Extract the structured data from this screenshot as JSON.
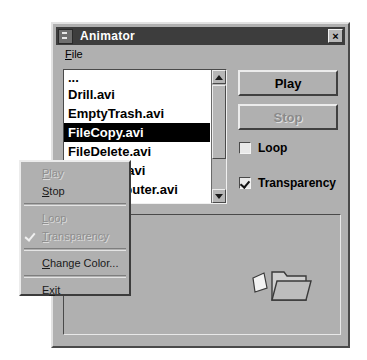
{
  "window": {
    "title": "Animator",
    "system_icon": "system-menu-icon",
    "close_label": "×",
    "close_icon": "close-icon"
  },
  "menubar": {
    "items": [
      {
        "label": "File",
        "accel": "F"
      }
    ]
  },
  "filelist": {
    "items": [
      {
        "label": "...",
        "selected": false,
        "partial": false
      },
      {
        "label": "Drill.avi",
        "selected": false,
        "partial": false
      },
      {
        "label": "EmptyTrash.avi",
        "selected": false,
        "partial": false
      },
      {
        "label": "FileCopy.avi",
        "selected": true,
        "partial": false
      },
      {
        "label": "FileDelete.avi",
        "selected": false,
        "partial": false
      },
      {
        "label": "FileMove.avi",
        "selected": false,
        "partial": false
      },
      {
        "label": "FindComputer.avi",
        "selected": false,
        "partial": true
      },
      {
        "label": "FindFile.avi",
        "selected": false,
        "partial": true
      },
      {
        "label": "SearchComputer.avi",
        "selected": false,
        "partial": true
      }
    ],
    "scrollbar": {
      "up_icon": "scroll-up-arrow-icon",
      "down_icon": "scroll-down-arrow-icon"
    }
  },
  "controls": {
    "play_label": "Play",
    "stop_label": "Stop",
    "loop_label": "Loop",
    "loop_checked": false,
    "transparency_label": "Transparency",
    "transparency_checked": true
  },
  "preview": {
    "animation_icon": "file-copy-folder-icon"
  },
  "popup_menu": {
    "items": [
      {
        "label": "Play",
        "accel": "P",
        "disabled": true,
        "checked": false,
        "type": "item"
      },
      {
        "label": "Stop",
        "accel": "S",
        "disabled": false,
        "checked": false,
        "type": "item"
      },
      {
        "type": "separator"
      },
      {
        "label": "Loop",
        "accel": "L",
        "disabled": true,
        "checked": false,
        "type": "item"
      },
      {
        "label": "Transparency",
        "accel": "T",
        "disabled": true,
        "checked": true,
        "type": "item"
      },
      {
        "type": "separator"
      },
      {
        "label": "Change Color...",
        "accel": "C",
        "disabled": false,
        "checked": false,
        "type": "item"
      },
      {
        "type": "separator"
      },
      {
        "label": "Exit",
        "accel": "x",
        "disabled": false,
        "checked": false,
        "type": "item"
      }
    ]
  },
  "colors": {
    "dialog_face": "#b0b0b0",
    "titlebar": "#3d3d3d",
    "titlebar_text": "#ffffff",
    "selection": "#000000",
    "selection_text": "#ffffff",
    "disabled_text": "#8e8e8e",
    "list_background": "#ffffff"
  }
}
